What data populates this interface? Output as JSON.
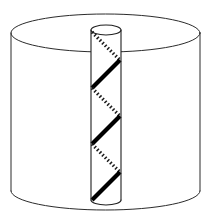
{
  "figure": {
    "name": "cylinder-with-helical-rod",
    "title": "",
    "background_color": "#ffffff",
    "line_color": "#2b2b2b",
    "helix_color": "#000000",
    "stroke_width": 1
  },
  "outer_cylinder": {
    "name": "outer-cylinder",
    "left_x": 11,
    "right_x": 200,
    "center_x": 105.5,
    "radius_x": 94.5,
    "top_ellipse_center_y": 33,
    "bottom_ellipse_center_y": 191,
    "radius_y": 19,
    "top_rim_visible": "full-ellipse",
    "bottom_rim_visible": "front-arc-only",
    "fill": "#ffffff"
  },
  "inner_rod": {
    "name": "inner-rod",
    "left_x": 91,
    "right_x": 121,
    "center_x": 106,
    "radius_x": 15,
    "top_ellipse_center_y": 30,
    "bottom_ellipse_center_y": 200,
    "radius_y": 5,
    "top_rim_visible": "full-ellipse",
    "bottom_rim_visible": "front-arc-only",
    "fill": "#ffffff"
  },
  "helix": {
    "name": "helical-stripe",
    "turns": 3,
    "pitch": 56,
    "start_y": 32,
    "direction": "right-handed",
    "front_segment_style": "solid",
    "back_segment_style": "dashed",
    "front_stroke_width": 4.2,
    "back_stroke_width": 3.4,
    "dash_pattern": "1.5 2.2",
    "segments": [
      {
        "index": 0,
        "kind": "back",
        "style": "dashed",
        "from_y": 32,
        "to_y": 60
      },
      {
        "index": 1,
        "kind": "front",
        "style": "solid",
        "from_y": 60,
        "to_y": 88
      },
      {
        "index": 2,
        "kind": "back",
        "style": "dashed",
        "from_y": 88,
        "to_y": 116
      },
      {
        "index": 3,
        "kind": "front",
        "style": "solid",
        "from_y": 116,
        "to_y": 144
      },
      {
        "index": 4,
        "kind": "back",
        "style": "dashed",
        "from_y": 144,
        "to_y": 172
      },
      {
        "index": 5,
        "kind": "front",
        "style": "solid",
        "from_y": 172,
        "to_y": 200
      }
    ]
  },
  "chart_data": {
    "type": "line",
    "title": "",
    "xlabel": "",
    "ylabel": ""
  }
}
